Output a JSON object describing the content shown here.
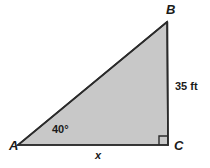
{
  "figure": {
    "background_color": "#ffffff",
    "fill_color": "#c8c8c8",
    "stroke_color": "#2b2b2b",
    "vertices": {
      "A": {
        "label": "A",
        "x": 18,
        "y": 145
      },
      "B": {
        "label": "B",
        "x": 167,
        "y": 22
      },
      "C": {
        "label": "C",
        "x": 168,
        "y": 145
      }
    },
    "sides": {
      "bc": {
        "label": "35 ft",
        "value": 35,
        "unit": "ft",
        "from": "B",
        "to": "C"
      },
      "ac": {
        "label": "x",
        "value": null,
        "unit": null,
        "from": "A",
        "to": "C"
      },
      "ab": {
        "label": "",
        "value": null,
        "unit": null,
        "from": "A",
        "to": "B"
      }
    },
    "angles": {
      "a": {
        "label": "40°",
        "value": 40,
        "unit": "degrees",
        "at": "A"
      },
      "c": {
        "label": "",
        "value": 90,
        "unit": "degrees",
        "at": "C",
        "marker": "right-angle-square"
      }
    }
  }
}
